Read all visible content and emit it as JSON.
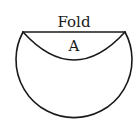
{
  "diagram": {
    "type": "folded-circle",
    "labels": {
      "fold": "Fold",
      "region": "A"
    },
    "colors": {
      "stroke": "#1a1a1a",
      "background": "#ffffff"
    },
    "geometry": {
      "circle_center": [
        74,
        74
      ],
      "circle_radius": 58,
      "fold_line_y": 32,
      "fold_line_x": [
        23,
        125
      ],
      "inner_arc_bottom_y": 60
    }
  }
}
